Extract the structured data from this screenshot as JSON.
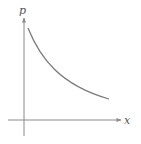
{
  "diagram": {
    "type": "decreasing-curve",
    "axes": {
      "vertical_label": "p",
      "horizontal_label": "x"
    },
    "colors": {
      "axis": "#8a8a8a",
      "curve": "#7a7a7a",
      "label": "#555555"
    }
  }
}
